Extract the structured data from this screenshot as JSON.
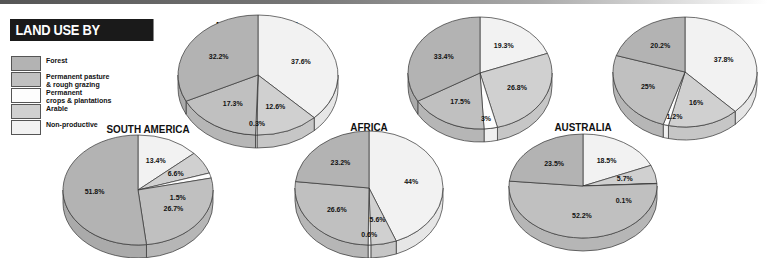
{
  "title": "LAND USE BY CONTINENT",
  "legend": [
    {
      "key": "forest",
      "label": "Forest",
      "color": "#b3b3b3"
    },
    {
      "key": "pasture",
      "label": "Permanent pasture\n& rough grazing",
      "color": "#c0c0c0"
    },
    {
      "key": "crops",
      "label": "Permanent\ncrops & plantations",
      "color": "#fdfdfd"
    },
    {
      "key": "arable",
      "label": "Arable",
      "color": "#d0d0d0"
    },
    {
      "key": "nonprod",
      "label": "Non-productive",
      "color": "#f2f2f2"
    }
  ],
  "chart_data": [
    {
      "type": "pie",
      "title": "NORTH AMERICA",
      "categories": [
        "Forest",
        "Permanent pasture & rough grazing",
        "Permanent crops & plantations",
        "Arable",
        "Non-productive"
      ],
      "values": [
        32.2,
        17.3,
        0.3,
        12.6,
        37.6
      ],
      "labels": [
        "32.2%",
        "17.3%",
        "0.3%",
        "12.6%",
        "37.6%"
      ]
    },
    {
      "type": "pie",
      "title": "SOUTH AMERICA",
      "categories": [
        "Forest",
        "Permanent pasture & rough grazing",
        "Permanent crops & plantations",
        "Arable",
        "Non-productive"
      ],
      "values": [
        51.8,
        26.7,
        1.5,
        6.6,
        13.4
      ],
      "labels": [
        "51.8%",
        "26.7%",
        "1.5%",
        "6.6%",
        "13.4%"
      ]
    },
    {
      "type": "pie",
      "title": "EUROPE",
      "categories": [
        "Forest",
        "Permanent pasture & rough grazing",
        "Permanent crops & plantations",
        "Arable",
        "Non-productive"
      ],
      "values": [
        33.4,
        17.5,
        3,
        26.8,
        19.3
      ],
      "labels": [
        "33.4%",
        "17.5%",
        "3%",
        "26.8%",
        "19.3%"
      ]
    },
    {
      "type": "pie",
      "title": "AFRICA",
      "categories": [
        "Forest",
        "Permanent pasture & rough grazing",
        "Permanent crops & plantations",
        "Arable",
        "Non-productive"
      ],
      "values": [
        23.2,
        26.6,
        0.6,
        5.6,
        44
      ],
      "labels": [
        "23.2%",
        "26.6%",
        "0.6%",
        "5.6%",
        "44%"
      ]
    },
    {
      "type": "pie",
      "title": "ASIA",
      "categories": [
        "Forest",
        "Permanent pasture & rough grazing",
        "Permanent crops & plantations",
        "Arable",
        "Non-productive"
      ],
      "values": [
        20.2,
        25,
        1.2,
        16,
        37.8
      ],
      "labels": [
        "20.2%",
        "25%",
        "1.2%",
        "16%",
        "37.8%"
      ]
    },
    {
      "type": "pie",
      "title": "AUSTRALIA",
      "categories": [
        "Forest",
        "Permanent pasture & rough grazing",
        "Permanent crops & plantations",
        "Arable",
        "Non-productive"
      ],
      "values": [
        23.5,
        52.2,
        0.1,
        5.7,
        18.5
      ],
      "labels": [
        "23.5%",
        "52.2%",
        "0.1%",
        "5.7%",
        "18.5%"
      ]
    }
  ],
  "layout": [
    {
      "cx": 258,
      "cy": 75,
      "rx": 80,
      "ry": 60,
      "depth": 13,
      "titleY": 20
    },
    {
      "cx": 138,
      "cy": 190,
      "rx": 75,
      "ry": 55,
      "depth": 13,
      "titleY": 124
    },
    {
      "cx": 480,
      "cy": 73,
      "rx": 72,
      "ry": 56,
      "depth": 13,
      "titleY": 18
    },
    {
      "cx": 369,
      "cy": 188,
      "rx": 74,
      "ry": 57,
      "depth": 13,
      "titleY": 122
    },
    {
      "cx": 685,
      "cy": 72,
      "rx": 72,
      "ry": 55,
      "depth": 13,
      "titleY": 18
    },
    {
      "cx": 583,
      "cy": 186,
      "rx": 74,
      "ry": 52,
      "depth": 13,
      "titleY": 122
    }
  ],
  "slice_order_clockwise_from_top": [
    "nonprod",
    "arable",
    "crops",
    "pasture",
    "forest"
  ]
}
